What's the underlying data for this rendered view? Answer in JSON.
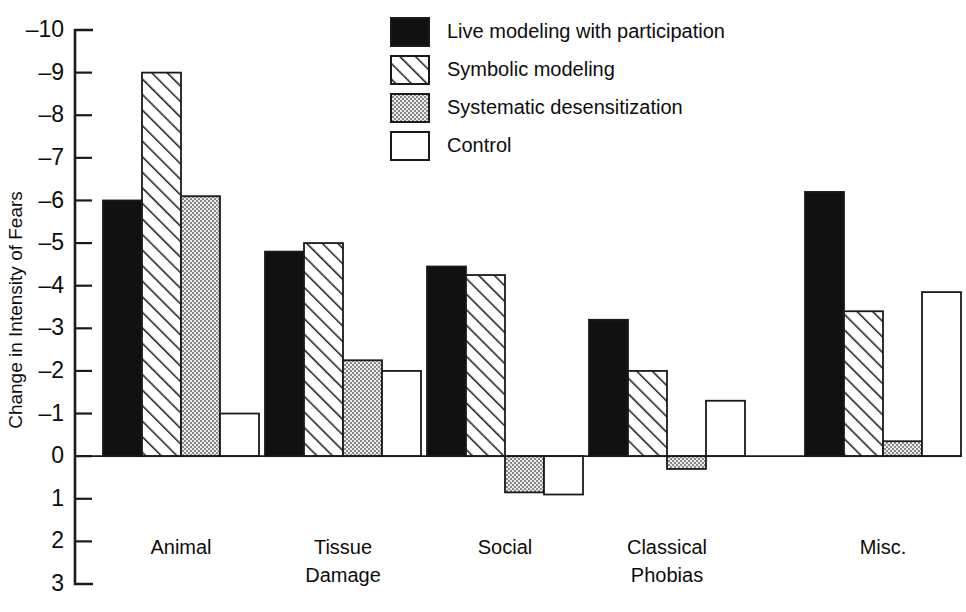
{
  "chart_data": {
    "type": "bar",
    "title": "",
    "xlabel": "",
    "ylabel": "Change in Intensity of Fears",
    "categories": [
      "Animal",
      "Tissue Damage",
      "Social",
      "Classical Phobias",
      "Misc."
    ],
    "category_lines": [
      [
        "Animal"
      ],
      [
        "Tissue",
        "Damage"
      ],
      [
        "Social"
      ],
      [
        "Classical",
        "Phobias"
      ],
      [
        "Misc."
      ]
    ],
    "ylim": [
      -10,
      3
    ],
    "y_axis_inverted": true,
    "y_ticks": [
      -10,
      -9,
      -8,
      -7,
      -6,
      -5,
      -4,
      -3,
      -2,
      -1,
      0,
      1,
      2,
      3
    ],
    "y_tick_labels": [
      "–10",
      "–9",
      "–8",
      "–7",
      "–6",
      "–5",
      "–4",
      "–3",
      "–2",
      "–1",
      "0",
      "1",
      "2",
      "3"
    ],
    "grid": false,
    "legend_position": "top-center",
    "series": [
      {
        "name": "Live modeling with participation",
        "fill": "black",
        "color": "#111111",
        "values": [
          -6.0,
          -4.8,
          -4.45,
          -3.2,
          -6.2
        ]
      },
      {
        "name": "Symbolic modeling",
        "fill": "diagonal-hatch",
        "color": "#ffffff",
        "values": [
          -9.0,
          -5.0,
          -4.25,
          -2.0,
          -3.4
        ]
      },
      {
        "name": "Systematic desensitization",
        "fill": "dotted",
        "color": "#d8d8d8",
        "values": [
          -6.1,
          -2.25,
          0.85,
          0.3,
          -0.35
        ]
      },
      {
        "name": "Control",
        "fill": "white",
        "color": "#ffffff",
        "values": [
          -1.0,
          -2.0,
          0.9,
          -1.3,
          -3.85
        ]
      }
    ]
  },
  "legend": {
    "items": [
      {
        "label": "Live modeling with participation",
        "fill": "black"
      },
      {
        "label": "Symbolic modeling",
        "fill": "diagonal-hatch"
      },
      {
        "label": "Systematic desensitization",
        "fill": "dotted"
      },
      {
        "label": "Control",
        "fill": "white"
      }
    ]
  },
  "axes": {
    "y_title": "Change in Intensity of Fears"
  }
}
